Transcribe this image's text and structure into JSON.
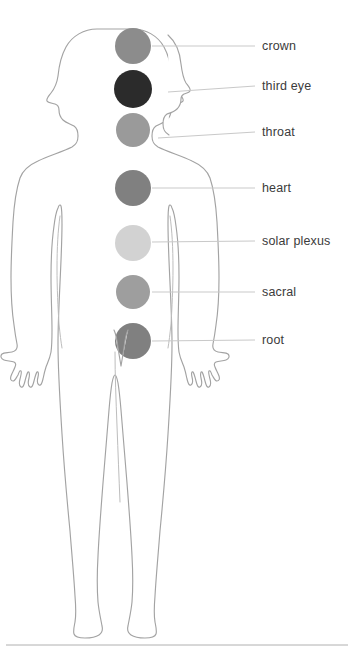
{
  "diagram": {
    "background_color": "#ffffff",
    "outline_color": "#a3a3a3",
    "leader_line_color": "#c9c9c9",
    "label_color": "#3b3b3b",
    "bottom_rule_color": "#b0b0b0"
  },
  "chakras": [
    {
      "id": "crown",
      "label": "crown",
      "color": "#8c8c8c",
      "cx": 133,
      "cy": 46,
      "r": 18,
      "line_x1": 152,
      "line_x2": 255,
      "label_x": 262,
      "label_y": 46
    },
    {
      "id": "third-eye",
      "label": "third eye",
      "color": "#2b2b2b",
      "cx": 133,
      "cy": 89,
      "r": 19,
      "line_x1": 168,
      "line_x2": 255,
      "label_x": 262,
      "label_y": 86
    },
    {
      "id": "throat",
      "label": "throat",
      "color": "#9a9a9a",
      "cx": 133,
      "cy": 130,
      "r": 17,
      "line_x1": 160,
      "line_x2": 255,
      "label_x": 262,
      "label_y": 132
    },
    {
      "id": "heart",
      "label": "heart",
      "color": "#808080",
      "cx": 133,
      "cy": 188,
      "r": 18,
      "line_x1": 152,
      "line_x2": 255,
      "label_x": 262,
      "label_y": 188
    },
    {
      "id": "solar-plexus",
      "label": "solar plexus",
      "color": "#d2d2d2",
      "cx": 133,
      "cy": 243,
      "r": 18,
      "line_x1": 152,
      "line_x2": 255,
      "label_x": 262,
      "label_y": 241
    },
    {
      "id": "sacral",
      "label": "sacral",
      "color": "#9e9e9e",
      "cx": 133,
      "cy": 292,
      "r": 17,
      "line_x1": 152,
      "line_x2": 255,
      "label_x": 262,
      "label_y": 292
    },
    {
      "id": "root",
      "label": "root",
      "color": "#808080",
      "cx": 133,
      "cy": 341,
      "r": 18,
      "line_x1": 152,
      "line_x2": 255,
      "label_x": 262,
      "label_y": 340
    }
  ],
  "bottom_rule": {
    "x1": 6,
    "x2": 348,
    "y": 645
  }
}
